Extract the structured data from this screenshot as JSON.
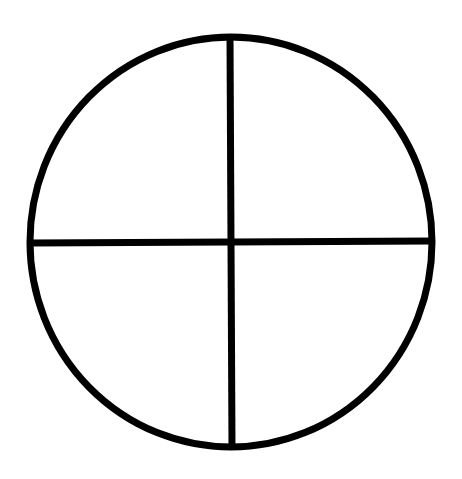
{
  "diagram": {
    "type": "circle-divided-into-quadrants",
    "background": "#ffffff",
    "stroke_color": "#000000",
    "stroke_width": 7,
    "circle": {
      "cx": 231,
      "cy": 242,
      "rx": 201,
      "ry": 205
    },
    "vertical_line": {
      "x1": 230,
      "y1": 37,
      "x2": 232,
      "y2": 448
    },
    "horizontal_line": {
      "x1": 31,
      "y1": 243,
      "x2": 432,
      "y2": 241
    },
    "quadrants": 4
  }
}
